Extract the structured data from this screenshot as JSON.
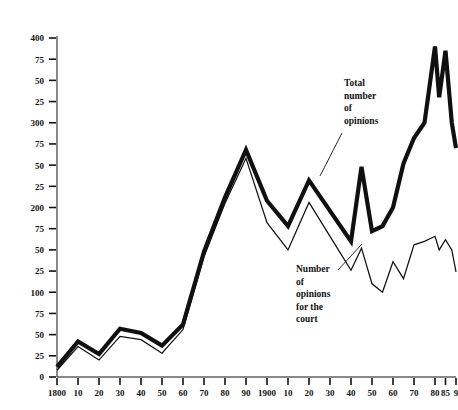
{
  "chart_data": {
    "type": "line",
    "title": "",
    "xlabel": "",
    "ylabel": "",
    "xlim": [
      1800,
      1990
    ],
    "ylim": [
      0,
      400
    ],
    "grid": false,
    "legend_position": "inline-annotations",
    "y_ticks": [
      0,
      25,
      50,
      75,
      100,
      125,
      150,
      175,
      200,
      225,
      250,
      275,
      300,
      325,
      350,
      375,
      400
    ],
    "y_tick_labels": [
      "0",
      "25",
      "50",
      "75",
      "100",
      "25",
      "50",
      "75",
      "200",
      "25",
      "50",
      "75",
      "300",
      "25",
      "50",
      "75",
      "400"
    ],
    "x_ticks": [
      1800,
      1810,
      1820,
      1830,
      1840,
      1850,
      1860,
      1870,
      1880,
      1890,
      1900,
      1910,
      1920,
      1930,
      1940,
      1950,
      1960,
      1970,
      1980,
      1985,
      1990
    ],
    "x_tick_labels": [
      "1800",
      "10",
      "20",
      "30",
      "40",
      "50",
      "60",
      "70",
      "80",
      "90",
      "1900",
      "10",
      "20",
      "30",
      "40",
      "50",
      "60",
      "70",
      "80",
      "85",
      "9"
    ],
    "series": [
      {
        "name": "Total number of opinions",
        "style": "thick",
        "x": [
          1800,
          1810,
          1820,
          1830,
          1840,
          1850,
          1860,
          1870,
          1880,
          1890,
          1900,
          1910,
          1920,
          1930,
          1940,
          1945,
          1950,
          1955,
          1960,
          1965,
          1970,
          1975,
          1980,
          1982,
          1985,
          1988,
          1990
        ],
        "values": [
          12,
          42,
          27,
          57,
          52,
          37,
          62,
          148,
          212,
          268,
          208,
          178,
          232,
          196,
          160,
          248,
          172,
          178,
          200,
          252,
          282,
          300,
          390,
          330,
          385,
          300,
          270
        ]
      },
      {
        "name": "Number of opinions for the court",
        "style": "thin",
        "x": [
          1800,
          1810,
          1820,
          1830,
          1840,
          1850,
          1860,
          1870,
          1880,
          1890,
          1900,
          1910,
          1920,
          1930,
          1940,
          1945,
          1950,
          1955,
          1960,
          1965,
          1970,
          1975,
          1980,
          1982,
          1985,
          1988,
          1990
        ],
        "values": [
          8,
          36,
          20,
          48,
          44,
          28,
          56,
          142,
          205,
          258,
          182,
          150,
          206,
          166,
          126,
          152,
          110,
          100,
          136,
          116,
          156,
          160,
          166,
          150,
          162,
          150,
          124
        ]
      }
    ],
    "annotations": [
      {
        "name": "total-opinions-annotation",
        "lines": [
          "Total",
          "number",
          "of",
          "opinions"
        ],
        "text_x": 344,
        "text_y": 86,
        "leader_from_x": 342,
        "leader_from_y": 133,
        "leader_to_x": 320,
        "leader_to_y": 176
      },
      {
        "name": "court-opinions-annotation",
        "lines": [
          "Number",
          "of",
          "opinions",
          "for the",
          "court"
        ],
        "text_x": 296,
        "text_y": 272,
        "leader_from_x": 338,
        "leader_from_y": 270,
        "leader_to_x": 362,
        "leader_to_y": 244
      }
    ]
  }
}
